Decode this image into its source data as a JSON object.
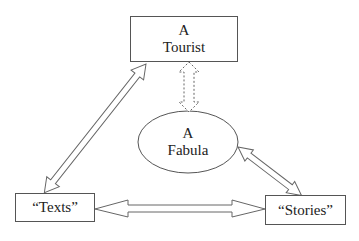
{
  "diagram": {
    "nodes": {
      "tourist": {
        "line1": "A",
        "line2": "Tourist",
        "shape": "rectangle"
      },
      "fabula": {
        "line1": "A",
        "line2": "Fabula",
        "shape": "ellipse"
      },
      "texts": {
        "label": "“Texts”",
        "shape": "rectangle"
      },
      "stories": {
        "label": "“Stories”",
        "shape": "rectangle"
      }
    },
    "edges": [
      {
        "from": "tourist",
        "to": "fabula",
        "style": "dashed double-headed arrow"
      },
      {
        "from": "tourist",
        "to": "texts",
        "style": "hollow double-headed arrow"
      },
      {
        "from": "texts",
        "to": "stories",
        "style": "hollow double-headed arrow"
      },
      {
        "from": "fabula",
        "to": "stories",
        "style": "hollow double-headed arrow"
      }
    ]
  }
}
